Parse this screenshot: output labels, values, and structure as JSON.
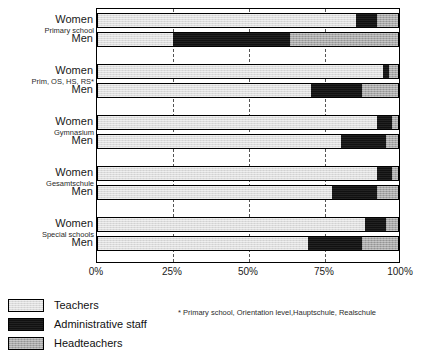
{
  "chart_data": {
    "type": "bar",
    "orientation": "horizontal",
    "stacked": true,
    "title": "",
    "xlabel": "",
    "ylabel": "",
    "xlim": [
      0,
      100
    ],
    "xtick_labels": [
      "0%",
      "25%",
      "50%",
      "75%",
      "100%"
    ],
    "xticks": [
      0,
      25,
      50,
      75,
      100
    ],
    "grid": "vertical-dashed",
    "legend_position": "bottom-left",
    "series": [
      {
        "name": "Teachers",
        "color": "#dcdcdc"
      },
      {
        "name": "Administrative staff",
        "color": "#111111"
      },
      {
        "name": "Headteachers",
        "color": "#a8a8a8"
      }
    ],
    "groups": [
      {
        "label": "Primary school",
        "rows": [
          {
            "label": "Women",
            "values": [
              86,
              7,
              7
            ]
          },
          {
            "label": "Men",
            "values": [
              25,
              39,
              36
            ]
          }
        ]
      },
      {
        "label": "Prim, OS, HS, RS*",
        "rows": [
          {
            "label": "Women",
            "values": [
              95,
              2,
              3
            ]
          },
          {
            "label": "Men",
            "values": [
              71,
              17,
              12
            ]
          }
        ]
      },
      {
        "label": "Gymnasium",
        "rows": [
          {
            "label": "Women",
            "values": [
              93,
              5,
              2
            ]
          },
          {
            "label": "Men",
            "values": [
              81,
              15,
              4
            ]
          }
        ]
      },
      {
        "label": "Gesamtschule",
        "rows": [
          {
            "label": "Women",
            "values": [
              93,
              5,
              2
            ]
          },
          {
            "label": "Men",
            "values": [
              78,
              15,
              7
            ]
          }
        ]
      },
      {
        "label": "Special schools",
        "rows": [
          {
            "label": "Women",
            "values": [
              89,
              7,
              4
            ]
          },
          {
            "label": "Men",
            "values": [
              70,
              18,
              12
            ]
          }
        ]
      }
    ]
  },
  "legend": {
    "items": [
      {
        "label": "Teachers",
        "key": "teachers"
      },
      {
        "label": "Administrative staff",
        "key": "admin"
      },
      {
        "label": "Headteachers",
        "key": "head"
      }
    ]
  },
  "footnote": {
    "text": "* Primary school, Orientation level,Hauptschule, Realschule"
  }
}
